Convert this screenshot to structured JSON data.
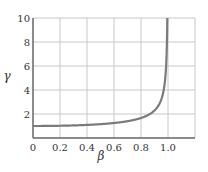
{
  "chart_data": {
    "type": "line",
    "title": "",
    "xlabel": "β",
    "ylabel": "γ",
    "xlim": [
      0,
      1.2
    ],
    "ylim": [
      0,
      10
    ],
    "x_ticks": [
      "0",
      "0.2",
      "0.4",
      "0.6",
      "0.8",
      "1.0"
    ],
    "y_ticks": [
      "2",
      "4",
      "6",
      "8",
      "10"
    ],
    "grid": true,
    "legend": null,
    "series": [
      {
        "name": "γ = 1/√(1−β²)",
        "color": "#7a7a7a",
        "x": [
          0,
          0.2,
          0.4,
          0.6,
          0.8,
          0.85,
          0.9,
          0.93,
          0.95,
          0.97,
          0.98,
          0.99,
          0.995
        ],
        "y": [
          1.0,
          1.02,
          1.09,
          1.25,
          1.67,
          1.9,
          2.29,
          2.72,
          3.2,
          4.11,
          5.03,
          7.09,
          10.0
        ]
      }
    ]
  },
  "colors": {
    "grid": "#c8c8c8",
    "axis": "#666666",
    "curve": "#7a7a7a",
    "text": "#333333"
  }
}
